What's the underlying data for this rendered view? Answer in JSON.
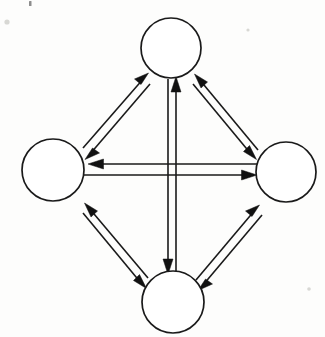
{
  "figure": {
    "kind": "directed-graph-diagram",
    "background_color": "#fdfdfc",
    "ink_color": "#1a1a1a",
    "width": 325,
    "height": 337,
    "caption": "",
    "title": ""
  },
  "graph_data": {
    "type": "node-link-diagram",
    "layout": "diamond",
    "directed": true,
    "node_count": 4,
    "edge_count": 6,
    "bidirectional": true,
    "node_label_text": "",
    "nodes": [
      {
        "id": "top",
        "label": "",
        "cx": 171,
        "cy": 48,
        "r": 30
      },
      {
        "id": "left",
        "label": "",
        "cx": 53,
        "cy": 170,
        "r": 31
      },
      {
        "id": "right",
        "label": "",
        "cx": 286,
        "cy": 172,
        "r": 30
      },
      {
        "id": "bottom",
        "label": "",
        "cx": 173,
        "cy": 302,
        "r": 31
      }
    ],
    "edges": [
      {
        "id": "top-left",
        "from": "top",
        "to": "left",
        "style": "double-line-opposed-arrows",
        "label": ""
      },
      {
        "id": "top-right",
        "from": "top",
        "to": "right",
        "style": "double-line-opposed-arrows",
        "label": ""
      },
      {
        "id": "left-bottom",
        "from": "left",
        "to": "bottom",
        "style": "double-line-opposed-arrows",
        "label": ""
      },
      {
        "id": "right-bottom",
        "from": "right",
        "to": "bottom",
        "style": "double-line-opposed-arrows",
        "label": ""
      },
      {
        "id": "top-bottom",
        "from": "top",
        "to": "bottom",
        "style": "double-line-opposed-arrows",
        "label": ""
      },
      {
        "id": "left-right",
        "from": "left",
        "to": "right",
        "style": "double-line-opposed-arrows",
        "label": ""
      }
    ]
  }
}
